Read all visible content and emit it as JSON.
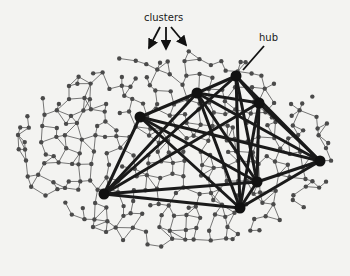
{
  "labels": {
    "clusters": "clusters",
    "hub": "hub"
  },
  "colors": {
    "background": "#f3f3f1",
    "node": "#4a4a4a",
    "hub": "#111111",
    "edge": "#555555",
    "hub_edge": "#1a1a1a"
  },
  "hubs": [
    {
      "x": 104,
      "y": 194
    },
    {
      "x": 140,
      "y": 117
    },
    {
      "x": 197,
      "y": 93
    },
    {
      "x": 236,
      "y": 76
    },
    {
      "x": 259,
      "y": 103
    },
    {
      "x": 320,
      "y": 161
    },
    {
      "x": 257,
      "y": 182
    },
    {
      "x": 240,
      "y": 208
    }
  ],
  "hub_edges": [
    [
      0,
      1
    ],
    [
      0,
      2
    ],
    [
      0,
      3
    ],
    [
      0,
      4
    ],
    [
      0,
      7
    ],
    [
      0,
      6
    ],
    [
      1,
      2
    ],
    [
      1,
      6
    ],
    [
      1,
      7
    ],
    [
      1,
      5
    ],
    [
      2,
      3
    ],
    [
      2,
      4
    ],
    [
      2,
      6
    ],
    [
      2,
      7
    ],
    [
      2,
      5
    ],
    [
      3,
      4
    ],
    [
      3,
      6
    ],
    [
      3,
      7
    ],
    [
      3,
      5
    ],
    [
      4,
      7
    ],
    [
      4,
      6
    ],
    [
      4,
      5
    ],
    [
      5,
      6
    ],
    [
      5,
      7
    ],
    [
      6,
      7
    ]
  ],
  "cluster_arrows": [
    {
      "from": [
        160,
        27
      ],
      "to": [
        149,
        48
      ]
    },
    {
      "from": [
        166,
        27
      ],
      "to": [
        166,
        49
      ]
    },
    {
      "from": [
        171,
        27
      ],
      "to": [
        186,
        45
      ]
    }
  ],
  "hub_arrow": {
    "from": [
      264,
      46
    ],
    "to": [
      243,
      70
    ]
  }
}
